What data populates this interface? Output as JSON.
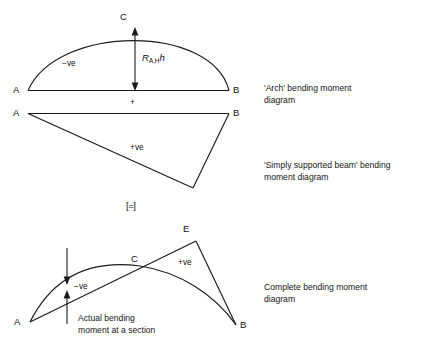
{
  "figure": {
    "title_alt": "Bending moment diagram decomposition for an arch",
    "line_color": "#1a1a1a",
    "text_color": "#111111"
  },
  "panels": [
    {
      "id": "arch",
      "caption": "'Arch' bending moment\ndiagram",
      "point_labels": {
        "left": "A",
        "right": "B",
        "apex": "C"
      },
      "sign_label": "−ve",
      "dimension_label_main": "R",
      "dimension_label_sub": "A,H",
      "dimension_label_tail": "h",
      "baseline_plus": "+"
    },
    {
      "id": "simply-supported-beam",
      "caption": "'Simply supported beam' bending\nmoment diagram",
      "point_labels": {
        "left": "A",
        "right": "B"
      },
      "sign_label": "+ve"
    },
    {
      "id": "equals",
      "symbol": "[=]"
    },
    {
      "id": "complete",
      "caption": "Complete bending moment\ndiagram",
      "point_labels": {
        "left": "A",
        "right": "B",
        "crossing": "C",
        "peak": "E"
      },
      "sign_label_negative": "−ve",
      "sign_label_positive": "+ve",
      "annotation": "Actual bending\nmoment at a section"
    }
  ]
}
